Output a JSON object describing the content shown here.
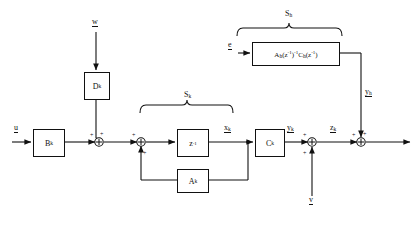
{
  "diagram": {
    "blocks": [
      {
        "id": "Bk",
        "label": "B",
        "sub": "k",
        "x": 33,
        "y": 129,
        "w": 30,
        "h": 26
      },
      {
        "id": "Dk",
        "label": "D",
        "sub": "k",
        "x": 84,
        "y": 72,
        "w": 24,
        "h": 26
      },
      {
        "id": "z1",
        "label": "z",
        "sup": "-1",
        "sub": "",
        "x": 177,
        "y": 129,
        "w": 30,
        "h": 26
      },
      {
        "id": "Ak",
        "label": "A",
        "sub": "k",
        "x": 177,
        "y": 169,
        "w": 30,
        "h": 22
      },
      {
        "id": "Ck",
        "label": "C",
        "sub": "k",
        "x": 255,
        "y": 129,
        "w": 28,
        "h": 26
      },
      {
        "id": "Sh",
        "label": "A_h(z^-1)^-1 C_h(z^-1)",
        "x": 252,
        "y": 42,
        "w": 86,
        "h": 22
      }
    ],
    "signals": {
      "input_left": "u",
      "input_top": "w",
      "input_noise": "e",
      "input_bottom": "v",
      "state": "x",
      "state_sub": "k",
      "output_ck": "y",
      "output_ck_sub": "k",
      "output_sh": "y",
      "output_sh_sub": "h",
      "output_z": "z",
      "output_z_sub": "k"
    },
    "braces": [
      {
        "id": "Sk",
        "label": "S",
        "sub": "k",
        "x": 140,
        "y": 104,
        "w": 92
      },
      {
        "id": "Sh",
        "label": "S",
        "sub": "h",
        "x": 237,
        "y": 20,
        "w": 105
      }
    ],
    "junctions": [
      {
        "id": "sum-1",
        "x": 99,
        "y": 142,
        "signs": [
          "+",
          "+"
        ]
      },
      {
        "id": "sum-2",
        "x": 141,
        "y": 142,
        "signs": [
          "+",
          "+"
        ]
      },
      {
        "id": "sum-3",
        "x": 312,
        "y": 142,
        "signs": [
          "+",
          "+"
        ]
      },
      {
        "id": "sum-4",
        "x": 361,
        "y": 142,
        "signs": [
          "+",
          "+"
        ]
      }
    ],
    "colors": {
      "line": "#111111",
      "background": "#ffffff"
    }
  }
}
